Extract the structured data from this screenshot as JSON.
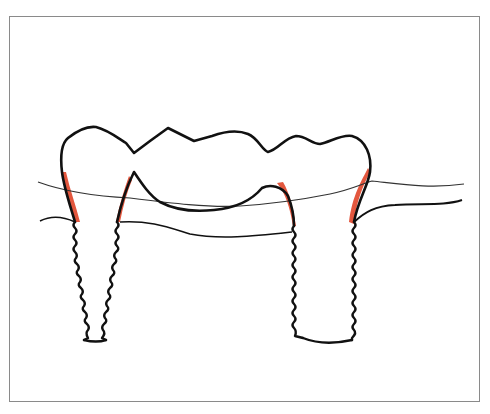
{
  "figure": {
    "frame": {
      "border_color": "#8a8a8a",
      "background": "#ffffff"
    },
    "colors": {
      "outline": "#111111",
      "gingiva_line": "#333333",
      "bone_line": "#111111",
      "highlight": "#e0452a"
    },
    "elements": [
      {
        "name": "bridge-crown",
        "description": "continuous crown outline spanning both abutments with pontic in middle"
      },
      {
        "name": "left-implant",
        "description": "tapered threaded implant fixture"
      },
      {
        "name": "right-implant",
        "description": "parallel threaded implant fixture"
      },
      {
        "name": "gingival-line",
        "description": "thin soft-tissue contour line"
      },
      {
        "name": "bone-crest-line",
        "description": "bone level contour line"
      },
      {
        "name": "marginal-highlights",
        "description": "red shaded zones along abutment/crown margins",
        "count": 4
      }
    ]
  }
}
